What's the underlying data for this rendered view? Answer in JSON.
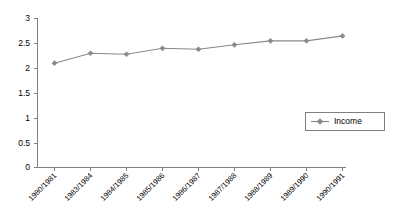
{
  "chart_data": {
    "type": "line",
    "title": "",
    "subtitle": "",
    "xlabel": "",
    "ylabel": "",
    "categories": [
      "1980/1981",
      "1983/1984",
      "1984/1985",
      "1985/1986",
      "1986/1987",
      "1987/1988",
      "1988/1989",
      "1989/1990",
      "1990/1991"
    ],
    "series": [
      {
        "name": "Income",
        "values": [
          2.1,
          2.3,
          2.28,
          2.4,
          2.38,
          2.47,
          2.55,
          2.55,
          2.65
        ],
        "color": "#898989",
        "marker": "diamond"
      }
    ],
    "ylim": [
      0,
      3
    ],
    "yticks": [
      0,
      0.5,
      1,
      1.5,
      2,
      2.5,
      3
    ],
    "ytick_labels": [
      "0",
      "0.5",
      "1",
      "1.5",
      "2",
      "2.5",
      "3"
    ],
    "grid": false,
    "legend": {
      "position": "right",
      "entries": [
        "Income"
      ],
      "bordered": true
    },
    "axis_color": "#808080",
    "xlabel_rotation": -45
  },
  "legend": {
    "income_label": "Income"
  }
}
